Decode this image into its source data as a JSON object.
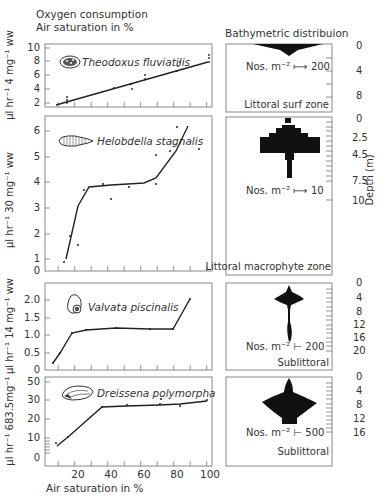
{
  "left_header": {
    "line1": "Oxygen consumption",
    "line2": "Air saturation in %"
  },
  "right_header": "Bathymetric distribuion",
  "x_axis": {
    "label": "Air saturation in %",
    "ticks": [
      "20",
      "40",
      "60",
      "80",
      "100"
    ]
  },
  "panels": [
    {
      "species": "Theodoxus fluviatilis",
      "ylabel": "µl hr⁻¹ 4 mg⁻¹ ww",
      "yticks": [
        "2",
        "4",
        "6",
        "8",
        "10"
      ],
      "scale_label": "Nos. m⁻² ⟼ 200",
      "zone": "Littoral surf zone",
      "depth_ticks": [
        "0",
        "4",
        "8"
      ]
    },
    {
      "species": "Helobdella stagnalis",
      "ylabel": "µl hr⁻¹ 30 mg⁻¹ ww",
      "yticks": [
        "0",
        "1",
        "2",
        "3",
        "4",
        "5",
        "6"
      ],
      "scale_label": "Nos. m⁻² ⟼ 10",
      "zone": "Littoral macrophyte zone",
      "depth_ticks": [
        "0",
        "2.5",
        "4.5",
        "7.5",
        "10"
      ],
      "depth_label": "Depth (m)"
    },
    {
      "species": "Valvata piscinalis",
      "ylabel": "µl hr⁻¹ 14 mg⁻¹ ww",
      "yticks": [
        "0",
        "0.5",
        "1.0",
        "1.5",
        "2.0"
      ],
      "scale_label": "Nos. m⁻² ⊢ 200",
      "zone": "Sublittoral",
      "depth_ticks": [
        "0",
        "4",
        "8",
        "12",
        "16",
        "20"
      ]
    },
    {
      "species": "Dreissena polymorpha",
      "ylabel": "µl hr⁻¹ 683.5mg⁻¹",
      "yticks": [
        "0",
        "10",
        "20",
        "30",
        "50"
      ],
      "scale_label": "Nos. m⁻² ⊢ 500",
      "zone": "Sublittoral",
      "depth_ticks": [
        "0",
        "4",
        "8",
        "12",
        "16"
      ]
    }
  ],
  "chart_data": [
    {
      "type": "line",
      "title": "Theodoxus fluviatilis",
      "xlabel": "Air saturation in %",
      "ylabel": "µl hr⁻¹ 4 mg⁻¹ ww",
      "xlim": [
        0,
        100
      ],
      "ylim": [
        1,
        10
      ],
      "series": [
        {
          "name": "fit",
          "x": [
            10,
            98
          ],
          "y": [
            1.7,
            8.6
          ]
        },
        {
          "name": "observations",
          "x": [
            13,
            13,
            13,
            42,
            52,
            53,
            60,
            60,
            79,
            80,
            80,
            97,
            98,
            98
          ],
          "y": [
            2.0,
            2.4,
            2.8,
            4.5,
            4.3,
            5.0,
            5.8,
            6.3,
            7.0,
            7.6,
            8.2,
            8.3,
            8.8,
            9.2
          ]
        }
      ]
    },
    {
      "type": "line",
      "title": "Helobdella stagnalis",
      "xlabel": "Air saturation in %",
      "ylabel": "µl hr⁻¹ 30 mg⁻¹ ww",
      "xlim": [
        0,
        100
      ],
      "ylim": [
        0,
        6.5
      ],
      "series": [
        {
          "name": "fit",
          "x": [
            13,
            22,
            27,
            40,
            60,
            68,
            80,
            87
          ],
          "y": [
            1.0,
            3.2,
            3.6,
            3.7,
            3.8,
            4.3,
            5.4,
            6.0
          ]
        },
        {
          "name": "observations",
          "x": [
            12,
            15,
            19,
            21,
            34,
            39,
            50,
            68,
            68,
            76,
            81,
            95
          ],
          "y": [
            1.0,
            2.0,
            1.6,
            3.8,
            4.0,
            3.45,
            3.9,
            4.0,
            5.1,
            5.3,
            6.2,
            5.35
          ]
        }
      ]
    },
    {
      "type": "line",
      "title": "Valvata piscinalis",
      "xlabel": "Air saturation in %",
      "ylabel": "µl hr⁻¹ 14 mg⁻¹ ww",
      "xlim": [
        0,
        100
      ],
      "ylim": [
        0,
        2.2
      ],
      "series": [
        {
          "name": "fit",
          "x": [
            10,
            15,
            22,
            31,
            50,
            70,
            80,
            88
          ],
          "y": [
            0.2,
            0.5,
            1.0,
            1.12,
            1.18,
            1.15,
            1.15,
            1.95
          ]
        },
        {
          "name": "observations",
          "x": [
            10,
            15,
            22,
            31,
            50,
            70,
            80,
            88
          ],
          "y": [
            0.2,
            0.5,
            1.0,
            1.12,
            1.18,
            1.15,
            1.15,
            1.95
          ]
        }
      ]
    },
    {
      "type": "line",
      "title": "Dreissena polymorpha",
      "xlabel": "Air saturation in %",
      "ylabel": "µl hr⁻¹ 683.5mg⁻¹",
      "xlim": [
        0,
        100
      ],
      "ylim": [
        0,
        55
      ],
      "series": [
        {
          "name": "fit",
          "x": [
            13,
            20,
            36,
            50,
            70,
            82,
            98
          ],
          "y": [
            4,
            9,
            26,
            27,
            28,
            28,
            29
          ]
        },
        {
          "name": "observations",
          "x": [
            12,
            19,
            36,
            50,
            70,
            70,
            82,
            98
          ],
          "y": [
            6,
            10,
            26,
            26.5,
            27,
            30,
            27,
            29.5
          ]
        }
      ]
    },
    {
      "type": "bar",
      "title": "Bathymetric distribution",
      "note": "Horizontal kite diagrams of abundance (Nos. m⁻²) vs depth (m)",
      "series": [
        {
          "name": "Theodoxus fluviatilis",
          "zone": "Littoral surf zone",
          "scale": 200,
          "depth_range_m": [
            0,
            2
          ]
        },
        {
          "name": "Helobdella stagnalis",
          "zone": "Littoral macrophyte zone",
          "scale": 10,
          "depth_range_m": [
            0,
            7
          ]
        },
        {
          "name": "Valvata piscinalis",
          "zone": "Sublittoral",
          "scale": 200,
          "depth_range_m": [
            0,
            16
          ]
        },
        {
          "name": "Dreissena polymorpha",
          "zone": "Sublittoral",
          "scale": 500,
          "depth_range_m": [
            0,
            12
          ]
        }
      ]
    }
  ]
}
